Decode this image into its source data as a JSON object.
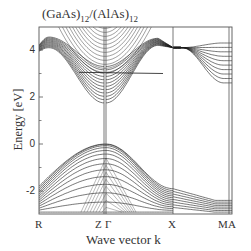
{
  "chart_data": {
    "type": "line",
    "title": "(GaAs)12/(AlAs)12",
    "title_parts": {
      "base1": "(GaAs)",
      "sub1": "12",
      "mid": "/(AlAs)",
      "sub2": "12"
    },
    "xlabel": "Wave vector k",
    "ylabel": "Energy [eV]",
    "ylim": [
      -2.95,
      5.0
    ],
    "yticks": [
      -2,
      0,
      2,
      4
    ],
    "yticks_minor": [
      -1,
      1,
      3
    ],
    "grid": false,
    "legend": null,
    "kpoints": [
      {
        "label": "R",
        "x": 39
      },
      {
        "label": "Z",
        "x": 104
      },
      {
        "label": "Γ",
        "x": 106
      },
      {
        "label": "X",
        "x": 173
      },
      {
        "label": "M",
        "x": 229
      },
      {
        "label": "A",
        "x": 232
      }
    ],
    "xtick_labels": [
      "R",
      "Z",
      "Γ",
      "X",
      "M",
      "A"
    ],
    "features": {
      "valence_band_max_eV": 0.0,
      "valence_band_max_at": "Γ",
      "conduction_band_min_eV": 1.75,
      "conduction_band_min_at": "Γ",
      "conduction_at_R_eV": 4.05,
      "conduction_at_X_eV": 4.1,
      "flat_band_crossing_eV": 3.0,
      "valence_at_R_eV": -2.1,
      "valence_at_M_eV": -2.4
    },
    "series": [
      {
        "name": "conduction-R-Z-folded",
        "segment": "R-Z",
        "count": 12,
        "E_start_range": [
          3.9,
          4.2
        ],
        "E_peak_range": [
          4.1,
          4.6
        ],
        "E_end_range": [
          1.75,
          3.3
        ]
      },
      {
        "name": "conduction-upper-parabolas",
        "segment": "R-Γ-X",
        "count": 12,
        "E_min_range": [
          3.0,
          5.0
        ]
      },
      {
        "name": "conduction-Γ-X",
        "segment": "Γ-X",
        "count": 12,
        "E_start_range": [
          1.75,
          3.3
        ],
        "E_peak_range": [
          4.2,
          4.5
        ],
        "E_end": 4.1
      },
      {
        "name": "conduction-X-M",
        "segment": "X-M",
        "count": 10,
        "E_start": 4.1,
        "E_end_range": [
          2.6,
          4.3
        ]
      },
      {
        "name": "valence-R-Γ",
        "segment": "R-Γ",
        "count": 14,
        "E_start_range": [
          -2.9,
          -1.8
        ],
        "E_end_range": [
          -2.9,
          0.0
        ]
      },
      {
        "name": "valence-Γ-X",
        "segment": "Γ-X",
        "count": 14,
        "E_start_range": [
          -2.9,
          0.0
        ],
        "E_end_range": [
          -2.9,
          -1.9
        ]
      },
      {
        "name": "valence-X-M",
        "segment": "X-M",
        "count": 8,
        "E_start_range": [
          -2.7,
          -1.9
        ],
        "E_end_range": [
          -2.9,
          -2.4
        ]
      }
    ]
  },
  "plot": {
    "left": 39,
    "right": 232,
    "top": 27,
    "bottom": 214,
    "zero_y": 144,
    "px_per_eV": 23.5,
    "line_color": "#1a1a1a",
    "frame_color": "#555555"
  }
}
